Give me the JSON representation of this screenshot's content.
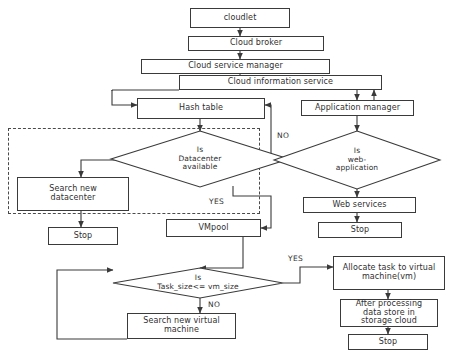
{
  "diagram": {
    "background_color": "#ffffff",
    "line_color": "#3a3a3a",
    "text_color": "#2f2f2f",
    "dashed_group_color": "#4a4a4a"
  },
  "nodes": {
    "cloudlet": {
      "label": "cloudlet",
      "shape": "process"
    },
    "cloud_broker": {
      "label": "Cloud broker",
      "shape": "process"
    },
    "cloud_service_manager": {
      "label": "Cloud service manager",
      "shape": "process"
    },
    "cloud_information_service": {
      "label": "Cloud information service",
      "shape": "process"
    },
    "hash_table": {
      "label": "Hash table",
      "shape": "process"
    },
    "application_manager": {
      "label": "Application manager",
      "shape": "process"
    },
    "is_datacenter_available": {
      "label": "Is\nDatacenter\navailable",
      "shape": "decision"
    },
    "is_web_application": {
      "label": "Is\nweb-\napplication",
      "shape": "decision"
    },
    "search_new_datacenter": {
      "label": "Search new\ndatacenter",
      "shape": "process"
    },
    "web_services": {
      "label": "Web services",
      "shape": "process"
    },
    "stop_left": {
      "label": "Stop",
      "shape": "terminal"
    },
    "stop_right": {
      "label": "Stop",
      "shape": "terminal"
    },
    "vmpool": {
      "label": "VMpool",
      "shape": "process"
    },
    "is_task_size": {
      "label": "Is\nTask_size<= vm_size",
      "shape": "decision"
    },
    "allocate_task": {
      "label": "Allocate task to virtual\nmachine(vm)",
      "shape": "process"
    },
    "after_processing": {
      "label": "After processing\ndata store in\nstorage cloud",
      "shape": "process"
    },
    "search_new_vm": {
      "label": "Search new virtual\nmachine",
      "shape": "process"
    },
    "stop_bottom": {
      "label": "Stop",
      "shape": "terminal"
    }
  },
  "edge_labels": {
    "datacenter_yes": "YES",
    "webapp_no": "NO",
    "tasksize_yes": "YES",
    "tasksize_no": "NO"
  }
}
